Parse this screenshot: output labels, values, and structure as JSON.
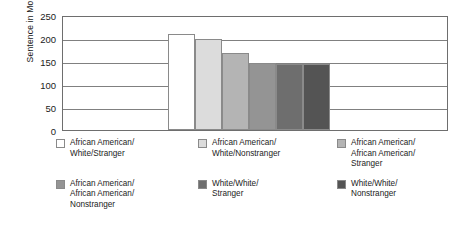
{
  "chart_data": {
    "type": "bar",
    "title": "",
    "xlabel": "",
    "ylabel": "Sentence in Months",
    "ylim": [
      0,
      250
    ],
    "yticks": [
      0,
      50,
      100,
      150,
      200,
      250
    ],
    "ytick_labels": [
      "0",
      "50",
      "100",
      "150",
      "200",
      "250"
    ],
    "grid": true,
    "legend_position": "bottom",
    "categories": [
      "African American/White/Stranger",
      "African American/White/Nonstranger",
      "African American/African American/Stranger",
      "African American/African American/Nonstranger",
      "White/White/Stranger",
      "White/White/Nonstranger"
    ],
    "values": [
      209,
      197,
      168,
      145,
      143,
      144
    ],
    "colors": [
      "#ffffff",
      "#dcdcdc",
      "#b4b4b4",
      "#949494",
      "#6e6e6e",
      "#545454"
    ]
  },
  "axis": {
    "y_title": "Sentence in Months",
    "tick_labels": [
      "250",
      "200",
      "150",
      "100",
      "50",
      "0"
    ]
  },
  "legend": {
    "items": [
      {
        "label": "African American/\nWhite/Stranger",
        "color": "#ffffff"
      },
      {
        "label": "African American/\nWhite/Nonstranger",
        "color": "#dcdcdc"
      },
      {
        "label": "African American/\nAfrican American/\nStranger",
        "color": "#b4b4b4"
      },
      {
        "label": "African American/\nAfrican American/\nNonstranger",
        "color": "#949494"
      },
      {
        "label": "White/White/\nStranger",
        "color": "#6e6e6e"
      },
      {
        "label": "White/White/\nNonstranger",
        "color": "#545454"
      }
    ]
  }
}
